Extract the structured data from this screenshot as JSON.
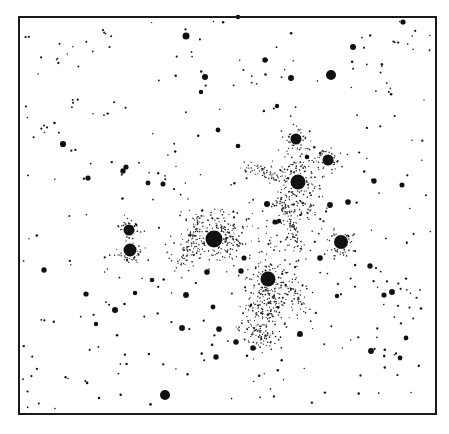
{
  "illustration": {
    "subject": "star field with reflection nebulosity around bright cluster stars",
    "background": "#ffffff",
    "ink": "#111111",
    "frame": {
      "x": 19,
      "y": 17,
      "width": 417,
      "height": 397
    }
  },
  "bright_stars": [
    {
      "x": 214,
      "y": 239,
      "r": 8.5,
      "nebula": {
        "rx": 36,
        "ry": 24,
        "density": 260,
        "angle": -20
      }
    },
    {
      "x": 268,
      "y": 279,
      "r": 7.5,
      "nebula": {
        "rx": 22,
        "ry": 48,
        "density": 360,
        "angle": 10,
        "dy": 18
      }
    },
    {
      "x": 298,
      "y": 182,
      "r": 7.5,
      "nebula": {
        "rx": 22,
        "ry": 30,
        "density": 220,
        "angle": 0,
        "dy": 5
      }
    },
    {
      "x": 341,
      "y": 242,
      "r": 7,
      "nebula": {
        "rx": 12,
        "ry": 13,
        "density": 90,
        "angle": 0
      }
    },
    {
      "x": 130,
      "y": 250,
      "r": 6.5,
      "nebula": {
        "rx": 12,
        "ry": 10,
        "density": 70,
        "angle": 0
      }
    },
    {
      "x": 129,
      "y": 230,
      "r": 5.5,
      "nebula": {
        "rx": 10,
        "ry": 9,
        "density": 50,
        "angle": 0
      }
    },
    {
      "x": 296,
      "y": 139,
      "r": 5.5,
      "nebula": {
        "rx": 10,
        "ry": 11,
        "density": 55,
        "angle": 0
      }
    },
    {
      "x": 328,
      "y": 160,
      "r": 5.5,
      "nebula": {
        "rx": 12,
        "ry": 10,
        "density": 60,
        "angle": 0
      }
    },
    {
      "x": 331,
      "y": 75,
      "r": 5,
      "nebula": null
    },
    {
      "x": 165,
      "y": 395,
      "r": 5,
      "nebula": null
    },
    {
      "x": 186,
      "y": 36,
      "r": 3.5,
      "nebula": null
    }
  ],
  "nebula_filaments": [
    {
      "x1": 200,
      "y1": 215,
      "x2": 180,
      "y2": 265,
      "density": 60
    },
    {
      "x1": 245,
      "y1": 165,
      "x2": 285,
      "y2": 180,
      "density": 50
    },
    {
      "x1": 280,
      "y1": 200,
      "x2": 300,
      "y2": 250,
      "density": 80
    },
    {
      "x1": 250,
      "y1": 320,
      "x2": 270,
      "y2": 345,
      "density": 40
    },
    {
      "x1": 290,
      "y1": 285,
      "x2": 305,
      "y2": 310,
      "density": 40
    }
  ],
  "medium_stars": [
    [
      63,
      144
    ],
    [
      88,
      178
    ],
    [
      123,
      171
    ],
    [
      126,
      167
    ],
    [
      148,
      183
    ],
    [
      163,
      184
    ],
    [
      218,
      130
    ],
    [
      238,
      146
    ],
    [
      267,
      204
    ],
    [
      275,
      222
    ],
    [
      279,
      221
    ],
    [
      320,
      258
    ],
    [
      348,
      202
    ],
    [
      374,
      181
    ],
    [
      402,
      185
    ],
    [
      392,
      292
    ],
    [
      370,
      266
    ],
    [
      406,
      338
    ],
    [
      371,
      351
    ],
    [
      300,
      334
    ],
    [
      244,
      258
    ],
    [
      241,
      271
    ],
    [
      186,
      295
    ],
    [
      207,
      272
    ],
    [
      213,
      307
    ],
    [
      219,
      329
    ],
    [
      216,
      357
    ],
    [
      182,
      328
    ],
    [
      135,
      293
    ],
    [
      115,
      310
    ],
    [
      86,
      294
    ],
    [
      44,
      270
    ],
    [
      96,
      324
    ],
    [
      152,
      280
    ],
    [
      238,
      17
    ],
    [
      353,
      47
    ],
    [
      403,
      22
    ],
    [
      205,
      77
    ],
    [
      265,
      60
    ],
    [
      291,
      78
    ],
    [
      201,
      92
    ],
    [
      277,
      106
    ],
    [
      307,
      157
    ],
    [
      236,
      342
    ],
    [
      253,
      348
    ],
    [
      330,
      205
    ],
    [
      384,
      295
    ],
    [
      337,
      296
    ],
    [
      400,
      358
    ]
  ],
  "faint_star_seed": 7,
  "faint_star_count": 340
}
